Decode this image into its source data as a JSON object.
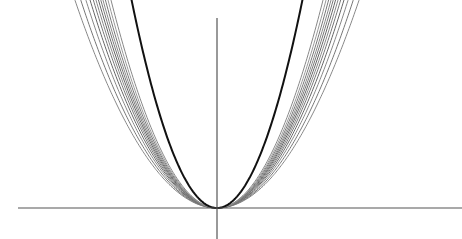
{
  "chart_data": {
    "type": "line",
    "title": "",
    "xlabel": "",
    "ylabel": "",
    "grid": false,
    "legend": null,
    "axes": {
      "origin_px": [
        217,
        208
      ],
      "x_axis_px": [
        18,
        462
      ],
      "y_axis_px": [
        18,
        239
      ],
      "color": "#555555"
    },
    "series": [
      {
        "name": "curve-1",
        "a": 0.0103,
        "x_range_px": [
          -185,
          200
        ],
        "color": "#888888",
        "width": 1
      },
      {
        "name": "curve-2",
        "a": 0.0112,
        "x_range_px": [
          -176,
          190
        ],
        "color": "#777777",
        "width": 1
      },
      {
        "name": "curve-3",
        "a": 0.0121,
        "x_range_px": [
          -170,
          184
        ],
        "color": "#888888",
        "width": 1
      },
      {
        "name": "curve-4",
        "a": 0.0129,
        "x_range_px": [
          -166,
          178
        ],
        "color": "#666666",
        "width": 1
      },
      {
        "name": "curve-5",
        "a": 0.0136,
        "x_range_px": [
          -163,
          174
        ],
        "color": "#777777",
        "width": 1
      },
      {
        "name": "curve-6",
        "a": 0.0142,
        "x_range_px": [
          -160,
          170
        ],
        "color": "#888888",
        "width": 1
      },
      {
        "name": "curve-7",
        "a": 0.0148,
        "x_range_px": [
          -157,
          166
        ],
        "color": "#666666",
        "width": 1
      },
      {
        "name": "curve-8",
        "a": 0.0154,
        "x_range_px": [
          -154,
          162
        ],
        "color": "#777777",
        "width": 1
      },
      {
        "name": "curve-9",
        "a": 0.016,
        "x_range_px": [
          -152,
          159
        ],
        "color": "#888888",
        "width": 1
      },
      {
        "name": "curve-10",
        "a": 0.0167,
        "x_range_px": [
          -150,
          156
        ],
        "color": "#777777",
        "width": 1
      },
      {
        "name": "curve-11",
        "a": 0.0175,
        "x_range_px": [
          -147,
          153
        ],
        "color": "#999999",
        "width": 1
      },
      {
        "name": "curve-12",
        "a": 0.0185,
        "x_range_px": [
          -140,
          148
        ],
        "color": "#888888",
        "width": 1
      },
      {
        "name": "highlighted",
        "a": 0.0285,
        "x_range_px": [
          -102,
          158
        ],
        "color": "#111111",
        "width": 2
      }
    ]
  }
}
